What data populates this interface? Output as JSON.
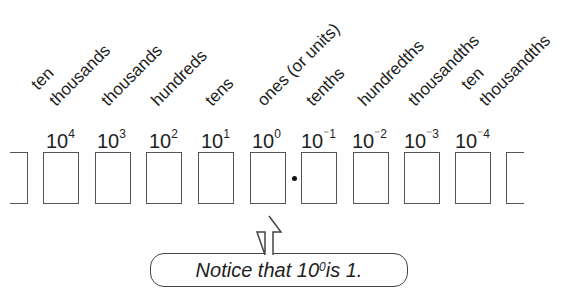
{
  "diagram": {
    "places": [
      {
        "label_line1": "ten",
        "label_line2": "thousands",
        "base": "10",
        "exponent": "4"
      },
      {
        "label_line1": "thousands",
        "label_line2": "",
        "base": "10",
        "exponent": "3"
      },
      {
        "label_line1": "hundreds",
        "label_line2": "",
        "base": "10",
        "exponent": "2"
      },
      {
        "label_line1": "tens",
        "label_line2": "",
        "base": "10",
        "exponent": "1"
      },
      {
        "label_line1": "ones (or units)",
        "label_line2": "",
        "base": "10",
        "exponent": "0"
      },
      {
        "label_line1": "tenths",
        "label_line2": "",
        "base": "10",
        "exponent": "⁻1"
      },
      {
        "label_line1": "hundredths",
        "label_line2": "",
        "base": "10",
        "exponent": "⁻2"
      },
      {
        "label_line1": "thousandths",
        "label_line2": "",
        "base": "10",
        "exponent": "⁻3"
      },
      {
        "label_line1": "ten",
        "label_line2": "thousandths",
        "base": "10",
        "exponent": "⁻4"
      }
    ],
    "decimal_point": ".",
    "callout": {
      "text_before": "Notice that 10",
      "exponent": "0",
      "text_after": " is 1."
    },
    "colors": {
      "line": "#555555",
      "text": "#1e1e1e",
      "background": "#ffffff"
    }
  }
}
